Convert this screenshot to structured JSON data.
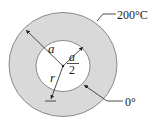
{
  "figure": {
    "type": "annular-cylinder-cross-section",
    "colors": {
      "ring_fill": "#d9d9d9",
      "ring_stroke": "#8a8a8a",
      "line": "#222222",
      "background": "#ffffff"
    },
    "labels": {
      "outer_radius": "a",
      "inner_radius_num": "a",
      "inner_radius_den": "2",
      "radial_coord": "r",
      "outer_temp": "200°C",
      "inner_temp": "0°"
    }
  }
}
